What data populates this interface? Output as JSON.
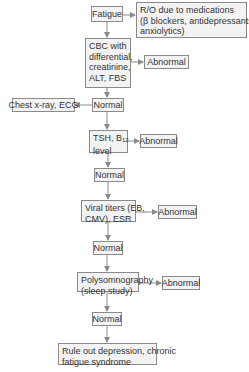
{
  "diagram": {
    "type": "flowchart",
    "nodes": {
      "fatigue": "Fatigue",
      "ro_meds_line1": "R/O due to medications",
      "ro_meds_line2": "(β blockers, antidepressants,",
      "ro_meds_line3": "anxiolytics)",
      "cbc_line1": "CBC with",
      "cbc_line2": "differential,",
      "cbc_line3": "creatinine,",
      "cbc_line4": "ALT, FBS",
      "abnormal1": "Abnormal",
      "chest": "Chest x-ray, ECG",
      "normal1": "Normal",
      "tsh_prefix": "TSH, B",
      "tsh_sub": "12",
      "tsh_line2": "level",
      "abnormal2": "Abnormal",
      "normal2": "Normal",
      "viral_line1": "Viral titers (EB,",
      "viral_line2": "CMV), ESR",
      "abnormal3": "Abnormal",
      "normal3": "Normal",
      "poly_line1": "Polysomnography",
      "poly_line2": "(sleep study)",
      "abnormal4": "Abnormal",
      "normal4": "Normal",
      "rule_line1": "Rule out depression, chronic",
      "rule_line2": "fatigue syndrome"
    },
    "edges": [
      [
        "Fatigue",
        "R/O due to medications"
      ],
      [
        "Fatigue",
        "CBC"
      ],
      [
        "CBC",
        "Abnormal"
      ],
      [
        "CBC",
        "Normal"
      ],
      [
        "Normal",
        "Chest x-ray, ECG"
      ],
      [
        "Normal",
        "TSH, B12 level"
      ],
      [
        "TSH, B12 level",
        "Abnormal"
      ],
      [
        "TSH, B12 level",
        "Normal"
      ],
      [
        "Normal",
        "Viral titers (EB, CMV), ESR"
      ],
      [
        "Viral titers",
        "Abnormal"
      ],
      [
        "Viral titers",
        "Normal"
      ],
      [
        "Normal",
        "Polysomnography (sleep study)"
      ],
      [
        "Polysomnography",
        "Abnormal"
      ],
      [
        "Polysomnography",
        "Normal"
      ],
      [
        "Normal",
        "Rule out depression, chronic fatigue syndrome"
      ]
    ],
    "colors": {
      "box_fill": "#f3f3f3",
      "border": "#8a8a8a",
      "arrow": "#8a8a8a",
      "text": "#333333"
    }
  }
}
